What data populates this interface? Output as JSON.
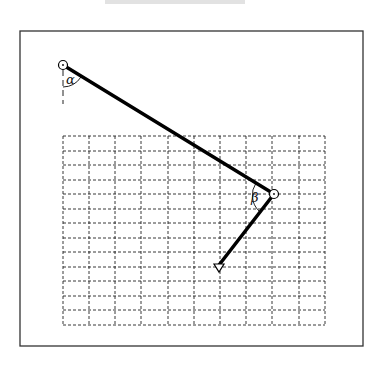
{
  "figure": {
    "type": "two-link arm diagram",
    "frame": {
      "x": 20,
      "y": 31,
      "width": 343,
      "height": 315,
      "stroke": "#333333"
    },
    "grid": {
      "x": 63,
      "y": 136,
      "cols": 10,
      "rows": 13,
      "width": 262,
      "height": 189,
      "stroke": "#222222",
      "dash": "3,2"
    },
    "shoulder": {
      "x": 63,
      "y": 65,
      "r": 4
    },
    "elbow": {
      "x": 274,
      "y": 194,
      "r": 4
    },
    "endpoint": {
      "x": 219,
      "y": 268
    },
    "arm_color": "#000000",
    "labels": {
      "alpha": "α",
      "beta": "β"
    }
  }
}
